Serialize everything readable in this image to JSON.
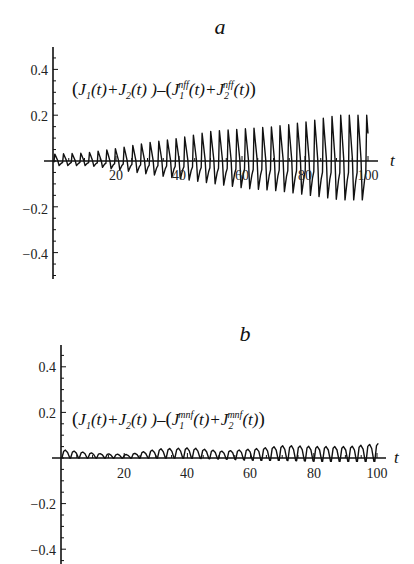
{
  "chart_data": [
    {
      "type": "line",
      "panel_label": "a",
      "title": "a",
      "xlabel": "t",
      "ylabel": "",
      "annotation": "(J1(t)+J2(t)) − (J1^nff(t)+J2^nff(t))",
      "xlim": [
        0,
        100
      ],
      "ylim": [
        -0.5,
        0.5
      ],
      "x_ticks": [
        20,
        40,
        60,
        80,
        100
      ],
      "y_ticks": [
        -0.4,
        -0.2,
        0.2,
        0.4
      ],
      "grid": false,
      "legend": null,
      "period": 2.75,
      "series": [
        {
          "name": "difference nff",
          "envelope_t": [
            0,
            10,
            20,
            30,
            40,
            50,
            60,
            70,
            80,
            90,
            100
          ],
          "envelope_max": [
            0.03,
            0.035,
            0.055,
            0.08,
            0.1,
            0.13,
            0.14,
            0.15,
            0.17,
            0.2,
            0.2
          ],
          "envelope_min": [
            -0.02,
            -0.02,
            -0.04,
            -0.06,
            -0.08,
            -0.1,
            -0.12,
            -0.13,
            -0.15,
            -0.17,
            -0.17
          ]
        }
      ]
    },
    {
      "type": "line",
      "panel_label": "b",
      "title": "b",
      "xlabel": "t",
      "ylabel": "",
      "annotation": "(J1(t)+J2(t)) − (J1^mnf(t)+J2^mnf(t))",
      "xlim": [
        0,
        100
      ],
      "ylim": [
        -0.45,
        0.5
      ],
      "x_ticks": [
        20,
        40,
        60,
        80,
        100
      ],
      "y_ticks": [
        -0.4,
        -0.2,
        0.2,
        0.4
      ],
      "grid": false,
      "legend": null,
      "period": 2.75,
      "series": [
        {
          "name": "difference mnf",
          "envelope_t": [
            0,
            10,
            20,
            30,
            40,
            50,
            60,
            70,
            80,
            90,
            100
          ],
          "envelope_max": [
            0.035,
            0.02,
            0.015,
            0.04,
            0.045,
            0.03,
            0.04,
            0.055,
            0.05,
            0.05,
            0.065
          ],
          "envelope_min": [
            0.0,
            0.0,
            0.0,
            0.0,
            0.0,
            -0.005,
            -0.01,
            -0.01,
            -0.015,
            -0.015,
            -0.015
          ]
        }
      ]
    }
  ],
  "panels": {
    "a": {
      "title": "a",
      "x_var": "t",
      "x_tick_labels": [
        "20",
        "40",
        "60",
        "80",
        "100"
      ],
      "y_tick_labels": [
        "0.4",
        "0.2",
        "−0.2",
        "−0.4"
      ],
      "formula": {
        "open": "(",
        "j1": "J",
        "j1_sub": "1",
        "t1": "(t)+",
        "j2": "J",
        "j2_sub": "2",
        "t2": "(t) )–",
        "open2": "(",
        "j3": "J",
        "j3_sub": "1",
        "j3_sup": "nff",
        "t3": "(t)+",
        "j4": "J",
        "j4_sub": "2",
        "j4_sup": "nff",
        "t4": "(t)",
        "close": ")"
      }
    },
    "b": {
      "title": "b",
      "x_var": "t",
      "x_tick_labels": [
        "20",
        "40",
        "60",
        "80",
        "100"
      ],
      "y_tick_labels": [
        "0.4",
        "0.2",
        "−0.2",
        "−0.4"
      ],
      "formula": {
        "open": "(",
        "j1": "J",
        "j1_sub": "1",
        "t1": "(t)+",
        "j2": "J",
        "j2_sub": "2",
        "t2": "(t) )–",
        "open2": "(",
        "j3": "J",
        "j3_sub": "1",
        "j3_sup": "mnf",
        "t3": "(t)+",
        "j4": "J",
        "j4_sub": "2",
        "j4_sup": "mnf",
        "t4": "(t)",
        "close": ")"
      }
    }
  }
}
